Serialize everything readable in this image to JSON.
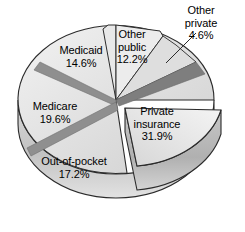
{
  "chart_data": {
    "type": "pie",
    "title": "",
    "subtitle": "",
    "xlabel": "",
    "ylabel": "",
    "legend_position": "none",
    "grid": false,
    "style": "3d-exploded-pie",
    "units": "percent",
    "total": "100.1",
    "categories": [
      "Private insurance",
      "Other private",
      "Other public",
      "Medicaid",
      "Medicare",
      "Out-of-pocket"
    ],
    "values": [
      31.9,
      4.6,
      12.2,
      14.6,
      19.6,
      17.2
    ],
    "slices": [
      {
        "name": "Private insurance",
        "value": 31.9,
        "label": "Private insurance",
        "value_label": "31.9%",
        "exploded": true,
        "fill": "#e9e9e9",
        "side_fill": "#c9c9c9"
      },
      {
        "name": "Other private",
        "value": 4.6,
        "label": "Other private",
        "value_label": "4.6%",
        "exploded": false,
        "leader_line": true,
        "fill": "#dcdcdc",
        "side_fill": "#bdbdbd"
      },
      {
        "name": "Other public",
        "value": 12.2,
        "label": "Other public",
        "value_label": "12.2%",
        "exploded": false,
        "raised": true,
        "fill": "#e4e4e4",
        "side_fill": "#c4c4c4"
      },
      {
        "name": "Medicaid",
        "value": 14.6,
        "label": "Medicaid",
        "value_label": "14.6%",
        "exploded": false,
        "fill": "#d7d7d7",
        "side_fill": "#b8b8b8"
      },
      {
        "name": "Medicare",
        "value": 19.6,
        "label": "Medicare",
        "value_label": "19.6%",
        "exploded": false,
        "fill": "#e0e0e0",
        "side_fill": "#c0c0c0"
      },
      {
        "name": "Out-of-pocket",
        "value": 17.2,
        "label": "Out-of-pocket",
        "value_label": "17.2%",
        "exploded": false,
        "fill": "#dadada",
        "side_fill": "#bababa"
      }
    ],
    "colors": {
      "divider": "#8c8c8c",
      "outline": "#2b2b2b",
      "background": "#ffffff",
      "text": "#000000"
    }
  }
}
